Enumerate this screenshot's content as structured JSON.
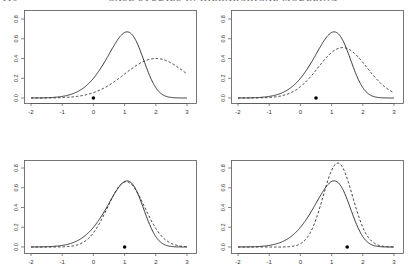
{
  "header": {
    "page_number": "110",
    "running_title": "CASE STUDIES IN HIERARCHICAL MODELING"
  },
  "chart_data": [
    {
      "type": "line",
      "panel": "top-left",
      "title": "",
      "xlabel": "",
      "ylabel": "",
      "xlim": [
        -2,
        3
      ],
      "ylim": [
        0,
        0.85
      ],
      "x_ticks": [
        "-2",
        "-1",
        "0",
        "1",
        "2",
        "3"
      ],
      "y_ticks": [
        "0.0",
        "0.2",
        "0.4",
        "0.6",
        "0.8"
      ],
      "grid": false,
      "series": [
        {
          "name": "solid",
          "style": "solid",
          "peak_x": 1.1,
          "peak_y": 0.67
        },
        {
          "name": "dashed",
          "style": "dashed",
          "peak_x": 2.0,
          "peak_y": 0.4
        }
      ],
      "point": {
        "x": 0.0,
        "y": 0.0
      }
    },
    {
      "type": "line",
      "panel": "top-right",
      "title": "",
      "xlabel": "",
      "ylabel": "",
      "xlim": [
        -2,
        3
      ],
      "ylim": [
        0,
        0.85
      ],
      "x_ticks": [
        "-2",
        "-1",
        "0",
        "1",
        "2",
        "3"
      ],
      "y_ticks": [
        "0.0",
        "0.2",
        "0.4",
        "0.6",
        "0.8"
      ],
      "grid": false,
      "series": [
        {
          "name": "solid",
          "style": "solid",
          "peak_x": 1.1,
          "peak_y": 0.67
        },
        {
          "name": "dashed",
          "style": "dashed",
          "peak_x": 1.35,
          "peak_y": 0.51
        }
      ],
      "point": {
        "x": 0.5,
        "y": 0.0
      }
    },
    {
      "type": "line",
      "panel": "bottom-left",
      "title": "",
      "xlabel": "",
      "ylabel": "",
      "xlim": [
        -2,
        3
      ],
      "ylim": [
        0,
        0.85
      ],
      "x_ticks": [
        "-2",
        "-1",
        "0",
        "1",
        "2",
        "3"
      ],
      "y_ticks": [
        "0.0",
        "0.2",
        "0.4",
        "0.6",
        "0.8"
      ],
      "grid": false,
      "series": [
        {
          "name": "solid",
          "style": "solid",
          "peak_x": 1.1,
          "peak_y": 0.67
        },
        {
          "name": "dashed",
          "style": "dashed",
          "peak_x": 1.1,
          "peak_y": 0.66
        }
      ],
      "point": {
        "x": 1.0,
        "y": 0.0
      }
    },
    {
      "type": "line",
      "panel": "bottom-right",
      "title": "",
      "xlabel": "",
      "ylabel": "",
      "xlim": [
        -2,
        3
      ],
      "ylim": [
        0,
        0.85
      ],
      "x_ticks": [
        "-2",
        "-1",
        "0",
        "1",
        "2",
        "3"
      ],
      "y_ticks": [
        "0.0",
        "0.2",
        "0.4",
        "0.6",
        "0.8"
      ],
      "grid": false,
      "series": [
        {
          "name": "solid",
          "style": "solid",
          "peak_x": 1.1,
          "peak_y": 0.67
        },
        {
          "name": "dashed",
          "style": "dashed",
          "peak_x": 1.2,
          "peak_y": 0.85
        }
      ],
      "point": {
        "x": 1.5,
        "y": 0.0
      }
    }
  ],
  "curve_params": {
    "solid": {
      "skew_alpha": -2.2,
      "loc": 1.55,
      "scale": 0.9
    },
    "dashed": [
      {
        "mu": 2.0,
        "sd": 1.0
      },
      {
        "mu": 1.35,
        "sd": 0.78
      },
      {
        "mu": 1.05,
        "sd": 0.6
      },
      {
        "mu": 1.2,
        "sd": 0.47
      }
    ]
  }
}
